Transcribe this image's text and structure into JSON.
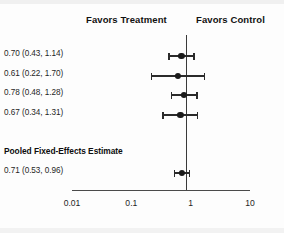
{
  "chart_data": {
    "type": "scatter",
    "plot_kind": "forest-plot",
    "title": "",
    "xlabel": "",
    "ylabel": "",
    "x_scale": "log",
    "xlim": [
      0.01,
      10
    ],
    "grid": false,
    "null_reference": 1,
    "axis_ticks": [
      "0.01",
      "0.1",
      "1",
      "10"
    ],
    "axis_tick_values": [
      0.01,
      0.1,
      1,
      10
    ],
    "headers": {
      "left": "Favors Treatment",
      "right": "Favors Control"
    },
    "pooled_section_title": "Pooled Fixed-Effects Estimate",
    "studies": [
      {
        "label": "0.70 (0.43, 1.14)",
        "estimate": 0.7,
        "ci_low": 0.43,
        "ci_high": 1.14,
        "pooled": false
      },
      {
        "label": "0.61 (0.22, 1.70)",
        "estimate": 0.61,
        "ci_low": 0.22,
        "ci_high": 1.7,
        "pooled": false
      },
      {
        "label": "0.78 (0.48, 1.28)",
        "estimate": 0.78,
        "ci_low": 0.48,
        "ci_high": 1.28,
        "pooled": false
      },
      {
        "label": "0.67 (0.34, 1.31)",
        "estimate": 0.67,
        "ci_low": 0.34,
        "ci_high": 1.31,
        "pooled": false
      },
      {
        "label": "0.71 (0.53, 0.96)",
        "estimate": 0.71,
        "ci_low": 0.53,
        "ci_high": 0.96,
        "pooled": true
      }
    ],
    "colors": {
      "marker": "#1b1b1b",
      "line": "#2b2b2b",
      "null_line": "#3a3a3a",
      "axis": "#4a4a4a",
      "background": "#fdfdfd",
      "text": "#1a1a1a"
    }
  }
}
